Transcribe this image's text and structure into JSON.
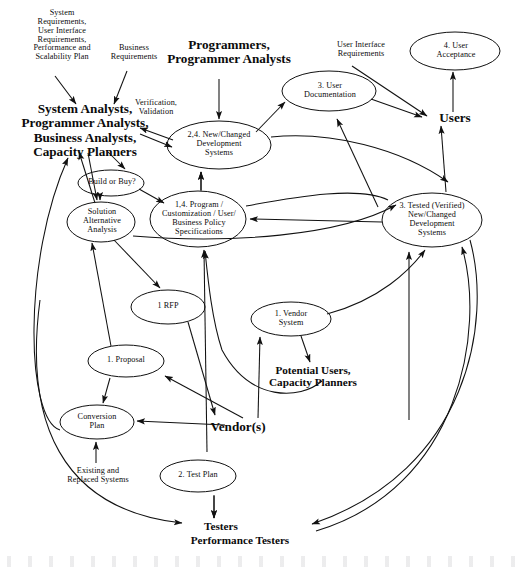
{
  "diagram": {
    "type": "data-flow-diagram",
    "stroke_color": "#111111",
    "background_color": "#ffffff",
    "processes": [
      {
        "id": "p_new_changed",
        "label": "2,4. New/Changed\nDevelopment\nSystems",
        "cx": 219,
        "cy": 145,
        "rx": 52,
        "ry": 24
      },
      {
        "id": "p_user_doc",
        "label": "3. User\nDocumentation",
        "cx": 329,
        "cy": 91,
        "rx": 47,
        "ry": 20
      },
      {
        "id": "p_user_acceptance",
        "label": "4. User\nAcceptance",
        "cx": 455,
        "cy": 51,
        "rx": 45,
        "ry": 19
      },
      {
        "id": "p_build_or_buy",
        "label": "Build or Buy?",
        "cx": 111,
        "cy": 183,
        "rx": 33,
        "ry": 13
      },
      {
        "id": "p_solution_alt",
        "label": "Solution\nAlternative\nAnalysis",
        "cx": 101,
        "cy": 222,
        "rx": 34,
        "ry": 20
      },
      {
        "id": "p_specs",
        "label": "1,4.  Program /\nCustomization / User/\nBusiness Policy\nSpecifications",
        "cx": 198,
        "cy": 219,
        "rx": 48,
        "ry": 28
      },
      {
        "id": "p_tested",
        "label": "3. Tested (Verified)\nNew/Changed\nDevelopment\nSystems",
        "cx": 432,
        "cy": 220,
        "rx": 50,
        "ry": 27
      },
      {
        "id": "p_rfp",
        "label": "1 RFP",
        "cx": 168,
        "cy": 307,
        "rx": 37,
        "ry": 17
      },
      {
        "id": "p_vendor_system",
        "label": "1.  Vendor\nSystem",
        "cx": 291,
        "cy": 319,
        "rx": 40,
        "ry": 17
      },
      {
        "id": "p_proposal",
        "label": "1.  Proposal",
        "cx": 126,
        "cy": 361,
        "rx": 38,
        "ry": 16
      },
      {
        "id": "p_conversion",
        "label": "Conversion\nPlan",
        "cx": 97,
        "cy": 422,
        "rx": 37,
        "ry": 17
      },
      {
        "id": "p_test_plan",
        "label": "2. Test Plan",
        "cx": 198,
        "cy": 476,
        "rx": 38,
        "ry": 16
      }
    ],
    "entities": [
      {
        "id": "e_analysts",
        "label": "System Analysts,\nProgrammer Analysts,\nBusiness Analysts,\nCapacity Planners",
        "x": 10,
        "y": 102,
        "w": 150,
        "size": "b13"
      },
      {
        "id": "e_programmers",
        "label": "Programmers,\nProgrammer Analysts",
        "x": 155,
        "y": 38,
        "w": 148,
        "size": "b13"
      },
      {
        "id": "e_users",
        "label": "Users",
        "x": 425,
        "y": 111,
        "w": 60,
        "size": "b13"
      },
      {
        "id": "e_vendors",
        "label": "Vendor(s)",
        "x": 200,
        "y": 420,
        "w": 76,
        "size": "b13"
      },
      {
        "id": "e_potential_users",
        "label": "Potential Users,\nCapacity Planners",
        "x": 252,
        "y": 364,
        "w": 122,
        "size": "b11"
      },
      {
        "id": "e_testers",
        "label": "Testers",
        "x": 190,
        "y": 520,
        "w": 62,
        "size": "b11"
      },
      {
        "id": "e_perf_testers",
        "label": "Performance Testers",
        "x": 165,
        "y": 534,
        "w": 150,
        "size": "b11"
      }
    ],
    "flow_labels": [
      {
        "id": "f_sys_req",
        "label": "System\nRequirements,\nUser Interface\nRequirements,\nPerformance and\nScalability Plan",
        "x": 16,
        "y": 9,
        "w": 92
      },
      {
        "id": "f_bus_req",
        "label": "Business\nRequirements",
        "x": 101,
        "y": 44,
        "w": 66
      },
      {
        "id": "f_verification",
        "label": "Verification,\nValidation",
        "x": 126,
        "y": 99,
        "w": 60
      },
      {
        "id": "f_ui_req",
        "label": "User Interface\nRequirements",
        "x": 323,
        "y": 41,
        "w": 76
      },
      {
        "id": "f_existing",
        "label": "Existing and\nReplaced Systems",
        "x": 52,
        "y": 467,
        "w": 92
      }
    ]
  }
}
